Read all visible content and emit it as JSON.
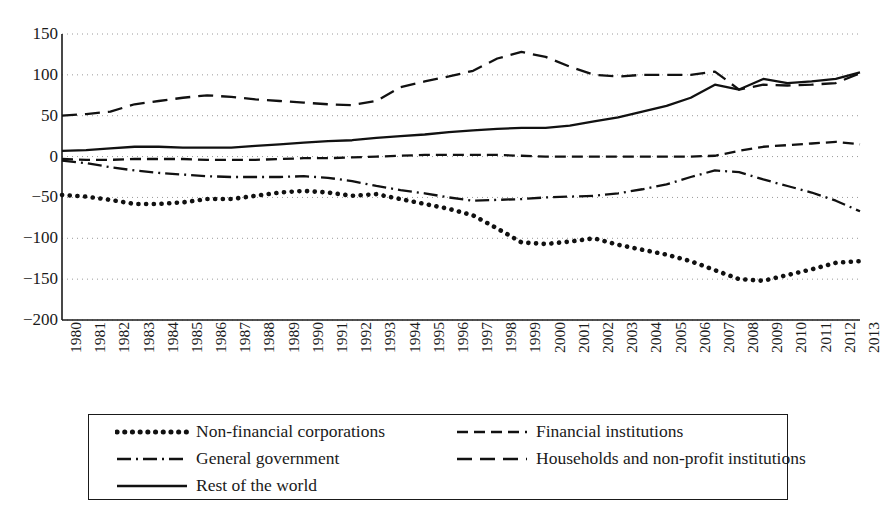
{
  "chart_data": {
    "type": "line",
    "title": "",
    "subtitle": "",
    "xlabel": "",
    "ylabel": "",
    "xlim": [
      1980,
      2013
    ],
    "ylim": [
      -200,
      150
    ],
    "yticks": [
      150,
      100,
      50,
      0,
      -50,
      -100,
      -150,
      -200
    ],
    "ytick_labels": [
      "150",
      "100",
      "50",
      "0",
      "−50",
      "−100",
      "−150",
      "−200"
    ],
    "grid": "horizontal-dotted",
    "legend_position": "below-plot",
    "x": [
      1980,
      1981,
      1982,
      1983,
      1984,
      1985,
      1986,
      1987,
      1988,
      1989,
      1990,
      1991,
      1992,
      1993,
      1994,
      1995,
      1996,
      1997,
      1998,
      1999,
      2000,
      2001,
      2002,
      2003,
      2004,
      2005,
      2006,
      2007,
      2008,
      2009,
      2010,
      2011,
      2012,
      2013
    ],
    "xtick_labels": [
      "1980",
      "1981",
      "1982",
      "1983",
      "1984",
      "1985",
      "1986",
      "1987",
      "1988",
      "1989",
      "1990",
      "1991",
      "1992",
      "1993",
      "1994",
      "1995",
      "1996",
      "1997",
      "1998",
      "1999",
      "2000",
      "2001",
      "2002",
      "2003",
      "2004",
      "2005",
      "2006",
      "2007",
      "2008",
      "2009",
      "2010",
      "2011",
      "2012",
      "2013"
    ],
    "series": [
      {
        "name": "Non-financial corporations",
        "style": "dotted",
        "color": "#111111",
        "values": [
          -47,
          -49,
          -53,
          -58,
          -58,
          -56,
          -52,
          -52,
          -48,
          -44,
          -42,
          -44,
          -48,
          -46,
          -52,
          -58,
          -64,
          -72,
          -88,
          -105,
          -107,
          -104,
          -100,
          -108,
          -114,
          -120,
          -128,
          -139,
          -150,
          -152,
          -145,
          -138,
          -130,
          -128
        ]
      },
      {
        "name": "General government",
        "style": "dashdot",
        "color": "#111111",
        "values": [
          -5,
          -8,
          -13,
          -17,
          -20,
          -22,
          -24,
          -25,
          -25,
          -25,
          -24,
          -26,
          -30,
          -36,
          -41,
          -45,
          -50,
          -54,
          -53,
          -52,
          -50,
          -49,
          -48,
          -45,
          -40,
          -34,
          -25,
          -17,
          -19,
          -28,
          -36,
          -44,
          -54,
          -67
        ]
      },
      {
        "name": "Rest of the world",
        "style": "solid",
        "color": "#111111",
        "values": [
          7,
          8,
          10,
          12,
          12,
          11,
          11,
          11,
          13,
          15,
          17,
          19,
          20,
          23,
          25,
          27,
          30,
          32,
          34,
          35,
          35,
          38,
          43,
          48,
          55,
          62,
          72,
          88,
          82,
          95,
          90,
          92,
          95,
          103
        ]
      },
      {
        "name": "Financial institutions",
        "style": "dashed",
        "color": "#111111",
        "values": [
          -3,
          -4,
          -4,
          -3,
          -3,
          -3,
          -4,
          -4,
          -4,
          -3,
          -2,
          -2,
          -1,
          0,
          1,
          2,
          2,
          2,
          2,
          1,
          0,
          0,
          0,
          0,
          0,
          0,
          0,
          1,
          7,
          12,
          14,
          16,
          18,
          15
        ]
      },
      {
        "name": "Households and non-profit institutions",
        "style": "dashed-wide",
        "color": "#111111",
        "values": [
          50,
          52,
          55,
          64,
          68,
          72,
          75,
          73,
          70,
          68,
          66,
          64,
          63,
          68,
          85,
          92,
          98,
          105,
          120,
          128,
          122,
          110,
          100,
          98,
          100,
          100,
          100,
          104,
          82,
          88,
          87,
          88,
          90,
          102
        ]
      }
    ]
  },
  "legend": {
    "entries": [
      {
        "label": "Non-financial corporations",
        "style": "dotted"
      },
      {
        "label": "Financial institutions",
        "style": "dashed"
      },
      {
        "label": "General government",
        "style": "dashdot"
      },
      {
        "label": "Households and non-profit institutions",
        "style": "dashed-wide"
      },
      {
        "label": "Rest of the world",
        "style": "solid"
      }
    ]
  }
}
